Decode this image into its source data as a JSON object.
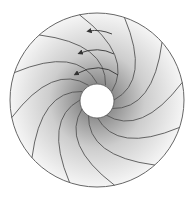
{
  "diagram": {
    "type": "spiral-annulus",
    "center": [
      97,
      100
    ],
    "outer_radius": 87,
    "inner_radius": 17,
    "blade_count": 12,
    "colors": {
      "line": "#555555",
      "fill_light": "#f4f4f4",
      "fill_dark": "#9a9a9a",
      "hole": "#ffffff"
    },
    "arrows": 3,
    "labels": []
  }
}
